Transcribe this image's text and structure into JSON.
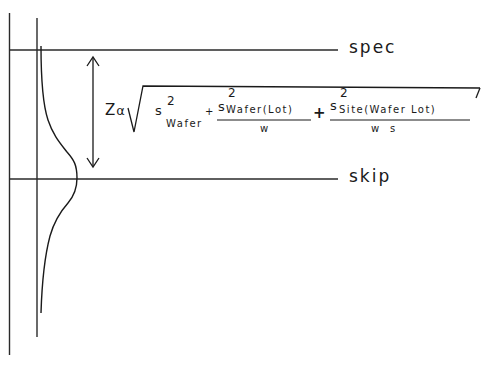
{
  "diagram": {
    "type": "distribution-threshold-sketch",
    "lines": {
      "upper": {
        "label": "spec"
      },
      "lower": {
        "label": "skip"
      }
    },
    "arrow": {
      "description": "double-headed vertical arrow spanning spec to skip"
    },
    "formula": {
      "prefix": "Z",
      "prefix_sub": "α",
      "radical": "sqrt",
      "terms": [
        {
          "base": "s",
          "exp": "2",
          "sub": "Wafer"
        },
        {
          "operator": "+",
          "numerator": {
            "base": "s",
            "exp": "2",
            "sub": "Wafer(Lot)"
          },
          "denominator": "w"
        },
        {
          "operator": "+",
          "numerator": {
            "base": "s",
            "exp": "2",
            "sub": "Site(Wafer Lot)"
          },
          "denominator": "w  s"
        }
      ]
    }
  }
}
